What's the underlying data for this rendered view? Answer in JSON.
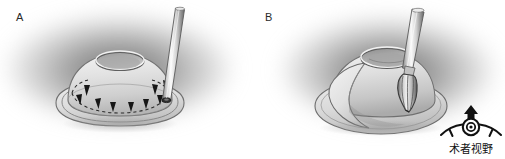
{
  "figure": {
    "width": 505,
    "height": 159,
    "background": "#ffffff",
    "type": "surgical-illustration-two-panel"
  },
  "panels": [
    {
      "id": "A",
      "label": "A",
      "halo_color": "#6e6e6e",
      "elements": {
        "base_plate": "oval-base-plate",
        "dome": "dome-body",
        "apex_opening": "apex-ellipse-opening",
        "guide_line": "dashed-guide-line",
        "arrowheads": 9,
        "instrument": "cylindrical-probe"
      }
    },
    {
      "id": "B",
      "label": "B",
      "halo_color": "#6c6c6c",
      "elements": {
        "base_plate": "oval-base-plate",
        "dome": "dome-body",
        "apex_opening": "apex-ellipse-opening",
        "flap": "lifted-flap",
        "instrument": "burr-drill",
        "burr_head": "flame-burr-head"
      }
    }
  ],
  "viewpoint_marker": {
    "icon": "surgeon-eye-icon",
    "arrow": "up-arrow",
    "caption": "术者视野"
  },
  "palette": {
    "ink": "#1a1a1a",
    "label": "#2a2a2a",
    "halo": "#6e6e6e",
    "tissue_light": "#e8e8e8",
    "tissue_mid": "#c9c9c9",
    "tissue_dark": "#9a9a9a",
    "metal_light": "#f2f2f2",
    "metal_mid": "#b9b9b9",
    "metal_dark": "#6f6f6f",
    "outline": "#4a4a4a"
  }
}
